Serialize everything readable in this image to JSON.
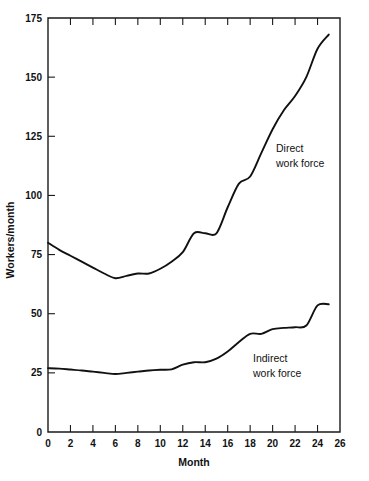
{
  "chart_data": {
    "type": "line",
    "title": "",
    "xlabel": "Month",
    "ylabel": "Workers/month",
    "xlim": [
      0,
      26
    ],
    "ylim": [
      0,
      175
    ],
    "xticks": [
      0,
      2,
      4,
      6,
      8,
      10,
      12,
      14,
      16,
      18,
      20,
      22,
      24,
      26
    ],
    "yticks": [
      0,
      25,
      50,
      75,
      100,
      125,
      150,
      175
    ],
    "xtick_labels": [
      "0",
      "2",
      "4",
      "6",
      "8",
      "10",
      "12",
      "14",
      "16",
      "18",
      "20",
      "22",
      "24",
      "26"
    ],
    "ytick_labels": [
      "0",
      "25",
      "50",
      "75",
      "100",
      "125",
      "150",
      "175"
    ],
    "grid": false,
    "legend_position": "inline-annotation",
    "series": [
      {
        "name": "Direct work force",
        "label_line1": "Direct",
        "label_line2": "work force",
        "color": "#111111",
        "x": [
          0,
          1,
          2,
          3,
          4,
          5,
          6,
          7,
          8,
          9,
          10,
          11,
          12,
          13,
          14,
          15,
          16,
          17,
          18,
          19,
          20,
          21,
          22,
          23,
          24,
          25
        ],
        "values": [
          80,
          77,
          74.5,
          72,
          69.5,
          67,
          65,
          66,
          67,
          67,
          69,
          72,
          76,
          84,
          84,
          84,
          95,
          105,
          108,
          118,
          128,
          136,
          142,
          150,
          162,
          168
        ]
      },
      {
        "name": "Indirect work force",
        "label_line1": "Indirect",
        "label_line2": "work force",
        "color": "#111111",
        "x": [
          0,
          1,
          2,
          3,
          4,
          5,
          6,
          7,
          8,
          9,
          10,
          11,
          12,
          13,
          14,
          15,
          16,
          17,
          18,
          19,
          20,
          21,
          22,
          23,
          24,
          25
        ],
        "values": [
          27,
          26.8,
          26.4,
          26,
          25.5,
          25,
          24.5,
          25,
          25.5,
          26,
          26.3,
          26.5,
          28.5,
          29.5,
          29.5,
          31,
          34,
          38,
          41.5,
          41.5,
          43.5,
          44,
          44.3,
          45,
          53.5,
          54
        ]
      }
    ],
    "annotations": [
      {
        "text": "Direct work force",
        "x_data": 19.0,
        "y_data": 124
      },
      {
        "text": "Indirect work force",
        "x_data": 17.5,
        "y_data": 35
      }
    ]
  },
  "figure": {
    "background": "#ffffff",
    "axis_color": "#1a1a1a",
    "line_color": "#111111"
  }
}
